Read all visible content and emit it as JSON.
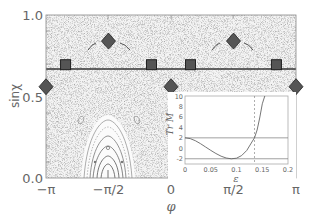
{
  "chart_data": [
    {
      "name": "main",
      "type": "scatter",
      "title": "",
      "xlabel": "φ",
      "ylabel": "sinχ",
      "xlim": [
        -3.14159,
        3.14159
      ],
      "ylim": [
        0.0,
        1.0
      ],
      "x_tick_labels": [
        "−π",
        "−π/2",
        "0",
        "π/2",
        "π"
      ],
      "y_tick_labels": [
        "0.0",
        "0.5",
        "1.0"
      ],
      "horizontal_line_y": 0.66,
      "background": "Poincaré section, chaotic sea of dots",
      "series": [
        {
          "name": "diamonds",
          "marker": "diamond",
          "points": [
            {
              "x": -3.14159,
              "y": 0.56
            },
            {
              "x": -1.5708,
              "y": 0.84
            },
            {
              "x": 0.0,
              "y": 0.56
            },
            {
              "x": 1.5708,
              "y": 0.84
            },
            {
              "x": 3.14159,
              "y": 0.56
            }
          ]
        },
        {
          "name": "squares",
          "marker": "square",
          "points": [
            {
              "x": -2.65,
              "y": 0.695
            },
            {
              "x": -0.49,
              "y": 0.695
            },
            {
              "x": 0.49,
              "y": 0.695
            },
            {
              "x": 2.65,
              "y": 0.695
            }
          ]
        }
      ],
      "annotations": [
        "closed contour island centered at φ=−π/2, sinχ=0",
        "small islands near φ≈−2.35 and φ≈−0.8, sinχ≈0.27"
      ]
    },
    {
      "name": "inset",
      "type": "line",
      "title": "",
      "xlabel": "ε",
      "ylabel": "Tr M",
      "xlim": [
        0,
        0.2
      ],
      "ylim": [
        -3,
        10
      ],
      "x_tick_labels": [
        "0",
        "0.05",
        "0.1",
        "0.15",
        "0.2"
      ],
      "y_tick_labels": [
        "-2",
        "0",
        "2",
        "4",
        "6",
        "8",
        "10"
      ],
      "reference_lines_y": [
        2,
        -2
      ],
      "reference_line_x": 0.135,
      "series": [
        {
          "name": "TrM",
          "x": [
            0,
            0.01,
            0.02,
            0.03,
            0.04,
            0.05,
            0.06,
            0.07,
            0.08,
            0.09,
            0.1,
            0.11,
            0.12,
            0.13,
            0.135,
            0.14,
            0.145,
            0.15,
            0.155
          ],
          "y": [
            2.0,
            1.85,
            1.45,
            0.9,
            0.25,
            -0.4,
            -1.0,
            -1.5,
            -1.85,
            -2.0,
            -1.9,
            -1.4,
            -0.4,
            1.2,
            2.0,
            3.5,
            5.8,
            8.5,
            10.5
          ]
        }
      ]
    }
  ]
}
